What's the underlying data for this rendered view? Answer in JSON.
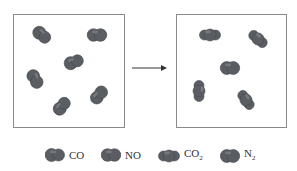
{
  "diagram": {
    "type": "reaction-particle-diagram",
    "colors": {
      "molecule": "#5a5e63",
      "molecule_highlight": "#8a8e92",
      "box_border": "#8a8a8a",
      "arrow": "#333333"
    },
    "left_box": {
      "label": "reactants",
      "molecules": [
        {
          "species": "CO",
          "x": 42,
          "y": 35,
          "angle": 40
        },
        {
          "species": "NO",
          "x": 97,
          "y": 35,
          "angle": 0
        },
        {
          "species": "CO",
          "x": 74,
          "y": 62,
          "angle": -20
        },
        {
          "species": "NO",
          "x": 35,
          "y": 79,
          "angle": 60
        },
        {
          "species": "CO",
          "x": 62,
          "y": 106,
          "angle": -50
        },
        {
          "species": "NO",
          "x": 99,
          "y": 95,
          "angle": -50
        }
      ]
    },
    "right_box": {
      "label": "products",
      "molecules": [
        {
          "species": "CO2",
          "x": 210,
          "y": 35,
          "angle": 0
        },
        {
          "species": "CO2",
          "x": 258,
          "y": 39,
          "angle": 40
        },
        {
          "species": "N2",
          "x": 230,
          "y": 68,
          "angle": 0
        },
        {
          "species": "CO2",
          "x": 199,
          "y": 91,
          "angle": 90
        },
        {
          "species": "CO2",
          "x": 246,
          "y": 100,
          "angle": 55
        }
      ]
    },
    "legend": [
      {
        "species": "CO",
        "label": "CO",
        "subscript": ""
      },
      {
        "species": "NO",
        "label": "NO",
        "subscript": ""
      },
      {
        "species": "CO2",
        "label": "CO",
        "subscript": "2"
      },
      {
        "species": "N2",
        "label": "N",
        "subscript": "2"
      }
    ]
  }
}
